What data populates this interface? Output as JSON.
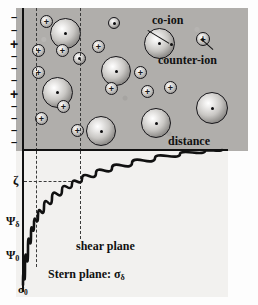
{
  "figure": {
    "background_color": "#fdfdfd",
    "solution_fill": "#b0aeab",
    "lower_panel_fill": "#f2f1ef",
    "ink_color": "#111111"
  },
  "labels": {
    "co_ion": "co-ion",
    "counter_ion": "counter-ion",
    "distance": "distance",
    "shear_plane": "shear plane",
    "stern_plane": "Stern plane: σ",
    "stern_plane_sub": "δ",
    "zeta": "ζ",
    "psi_delta": "Ψ",
    "psi_delta_sub": "δ",
    "psi_zero": "Ψ",
    "psi_zero_sub": "0",
    "sigma_zero": "σ",
    "sigma_zero_sub": "0"
  },
  "surface_charges": [
    {
      "sign": "-",
      "y": 4
    },
    {
      "sign": "-",
      "y": 17
    },
    {
      "sign": "+",
      "y": 29
    },
    {
      "sign": "-",
      "y": 43
    },
    {
      "sign": "-",
      "y": 55
    },
    {
      "sign": "-",
      "y": 67
    },
    {
      "sign": "+",
      "y": 79
    },
    {
      "sign": "-",
      "y": 93
    },
    {
      "sign": "-",
      "y": 105
    },
    {
      "sign": "-",
      "y": 117
    },
    {
      "sign": "-",
      "y": 129
    }
  ],
  "ions": {
    "co_ions": [
      {
        "x": 34,
        "y": 10,
        "d": 31
      },
      {
        "x": 26,
        "y": 69,
        "d": 31
      },
      {
        "x": 70,
        "y": 108,
        "d": 30
      },
      {
        "x": 85,
        "y": 48,
        "d": 30
      },
      {
        "x": 125,
        "y": 100,
        "d": 30
      },
      {
        "x": 128,
        "y": 20,
        "d": 31
      },
      {
        "x": 180,
        "y": 84,
        "d": 32
      },
      {
        "x": 92,
        "y": 9,
        "d": 12
      },
      {
        "x": 57,
        "y": 44,
        "d": 13
      }
    ],
    "counter_ions": [
      {
        "x": 24,
        "y": 7,
        "d": 13
      },
      {
        "x": 16,
        "y": 36,
        "d": 13
      },
      {
        "x": 16,
        "y": 58,
        "d": 13
      },
      {
        "x": 19,
        "y": 104,
        "d": 13
      },
      {
        "x": 40,
        "y": 36,
        "d": 13
      },
      {
        "x": 41,
        "y": 92,
        "d": 13
      },
      {
        "x": 55,
        "y": 116,
        "d": 13
      },
      {
        "x": 76,
        "y": 32,
        "d": 13
      },
      {
        "x": 89,
        "y": 74,
        "d": 13
      },
      {
        "x": 118,
        "y": 58,
        "d": 13
      },
      {
        "x": 125,
        "y": 77,
        "d": 13
      },
      {
        "x": 148,
        "y": 73,
        "d": 13
      },
      {
        "x": 180,
        "y": 24,
        "d": 14
      }
    ]
  },
  "chart_data": {
    "type": "line",
    "xlabel": "distance",
    "ylabel": "potential",
    "grid": false,
    "legend": false,
    "x_markers": [
      {
        "name": "Stern plane",
        "x_px": 36,
        "label": "Stern plane: σδ"
      },
      {
        "name": "shear plane",
        "x_px": 80,
        "label": "shear plane"
      }
    ],
    "y_markers": [
      {
        "name": "sigma_0",
        "label": "σ₀",
        "y_px": 290
      },
      {
        "name": "psi_0",
        "label": "Ψ₀",
        "y_px": 256
      },
      {
        "name": "psi_delta",
        "label": "Ψδ",
        "y_px": 222
      },
      {
        "name": "zeta",
        "label": "ζ",
        "y_px": 182
      }
    ],
    "series": [
      {
        "name": "potential",
        "points_px": [
          [
            23,
            285
          ],
          [
            25,
            268
          ],
          [
            28,
            248
          ],
          [
            31,
            234
          ],
          [
            34,
            224
          ],
          [
            38,
            216
          ],
          [
            44,
            207
          ],
          [
            52,
            198
          ],
          [
            62,
            190
          ],
          [
            72,
            184
          ],
          [
            82,
            179
          ],
          [
            96,
            173
          ],
          [
            112,
            168
          ],
          [
            132,
            163
          ],
          [
            155,
            158
          ],
          [
            180,
            154
          ],
          [
            205,
            151
          ],
          [
            222,
            150
          ]
        ],
        "description": "Exponential decay of potential from surface value to bulk (zero) with increasing distance"
      }
    ]
  }
}
